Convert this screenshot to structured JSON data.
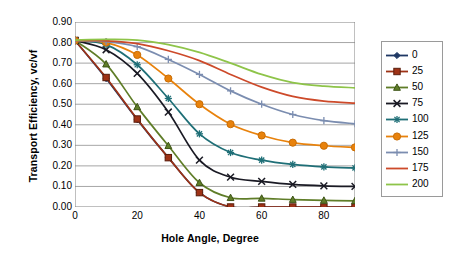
{
  "chart_data": {
    "type": "line",
    "title": "",
    "xlabel": "Hole Angle, Degree",
    "ylabel": "Transport Efficiency, vc/vf",
    "xlim": [
      0,
      90
    ],
    "ylim": [
      0.0,
      0.9
    ],
    "grid": "horizontal",
    "legend_position": "right",
    "xtick_labels": [
      "0",
      "20",
      "40",
      "60",
      "80"
    ],
    "xtick_values": [
      0,
      20,
      40,
      60,
      80
    ],
    "ytick_labels": [
      "0.00",
      "0.10",
      "0.20",
      "0.30",
      "0.40",
      "0.50",
      "0.60",
      "0.70",
      "0.80",
      "0.90"
    ],
    "ytick_values": [
      0.0,
      0.1,
      0.2,
      0.3,
      0.4,
      0.5,
      0.6,
      0.7,
      0.8,
      0.9
    ],
    "x": [
      0,
      10,
      20,
      30,
      40,
      50,
      60,
      70,
      80,
      90
    ],
    "series": [
      {
        "name": "0",
        "color": "#1f3864",
        "marker": "diamond",
        "values": [
          0.81,
          0.625,
          0.425,
          0.24,
          0.07,
          0.0,
          0.0,
          0.0,
          0.0,
          0.0
        ]
      },
      {
        "name": "25",
        "color": "#9e3216",
        "marker": "square",
        "values": [
          0.81,
          0.63,
          0.428,
          0.24,
          0.07,
          0.0,
          0.0,
          0.0,
          0.0,
          0.0
        ]
      },
      {
        "name": "50",
        "color": "#5f7d28",
        "marker": "triangle",
        "values": [
          0.81,
          0.695,
          0.487,
          0.298,
          0.118,
          0.045,
          0.042,
          0.036,
          0.032,
          0.03
        ]
      },
      {
        "name": "75",
        "color": "#1a1a24",
        "marker": "cross",
        "values": [
          0.81,
          0.765,
          0.65,
          0.462,
          0.228,
          0.145,
          0.125,
          0.11,
          0.103,
          0.1
        ]
      },
      {
        "name": "100",
        "color": "#1f6f77",
        "marker": "star",
        "values": [
          0.81,
          0.79,
          0.692,
          0.528,
          0.356,
          0.265,
          0.228,
          0.207,
          0.195,
          0.19
        ]
      },
      {
        "name": "125",
        "color": "#e8820c",
        "marker": "circle",
        "values": [
          0.81,
          0.8,
          0.74,
          0.625,
          0.5,
          0.403,
          0.348,
          0.313,
          0.298,
          0.29
        ]
      },
      {
        "name": "150",
        "color": "#7b8db0",
        "marker": "plus",
        "values": [
          0.81,
          0.805,
          0.78,
          0.718,
          0.645,
          0.565,
          0.5,
          0.45,
          0.42,
          0.405
        ]
      },
      {
        "name": "175",
        "color": "#cd4a2a",
        "marker": "none",
        "values": [
          0.81,
          0.808,
          0.795,
          0.76,
          0.712,
          0.645,
          0.583,
          0.538,
          0.515,
          0.505
        ]
      },
      {
        "name": "200",
        "color": "#8ec449",
        "marker": "none",
        "values": [
          0.812,
          0.815,
          0.812,
          0.79,
          0.752,
          0.7,
          0.645,
          0.605,
          0.588,
          0.58
        ]
      }
    ]
  }
}
